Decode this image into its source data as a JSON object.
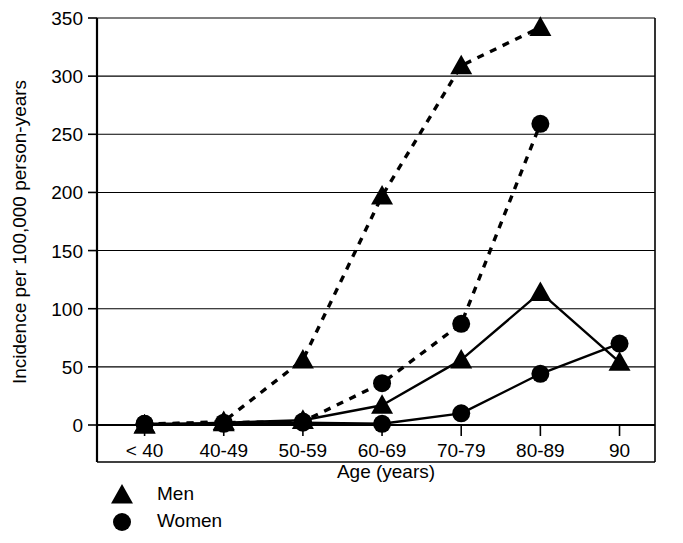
{
  "chart_data": {
    "type": "line",
    "title": "",
    "xlabel": "Age (years)",
    "ylabel": "Incidence per 100,000 person-years",
    "categories": [
      "< 40",
      "40-49",
      "50-59",
      "60-69",
      "70-79",
      "80-89",
      "90"
    ],
    "ylim": [
      0,
      350
    ],
    "yticks": [
      0,
      50,
      100,
      150,
      200,
      250,
      300,
      350
    ],
    "ytick_labels": [
      "0",
      "50",
      "100",
      "150",
      "200",
      "250",
      "300",
      "350"
    ],
    "grid": "horizontal",
    "legend_position": "below-axes-left",
    "series": [
      {
        "name": "Men",
        "marker": "triangle",
        "linestyle": "dashed",
        "group": "upper",
        "values": [
          0,
          3,
          56,
          197,
          309,
          342,
          null
        ]
      },
      {
        "name": "Women",
        "marker": "circle",
        "linestyle": "dashed",
        "group": "upper",
        "values": [
          1,
          2,
          3,
          36,
          87,
          259,
          null
        ]
      },
      {
        "name": "Men",
        "marker": "triangle",
        "linestyle": "solid",
        "group": "lower",
        "values": [
          0,
          2,
          4,
          17,
          56,
          114,
          54
        ]
      },
      {
        "name": "Women",
        "marker": "circle",
        "linestyle": "solid",
        "group": "lower",
        "values": [
          1,
          1,
          2,
          1,
          10,
          44,
          70
        ]
      }
    ],
    "legend": [
      {
        "label": "Men",
        "marker": "triangle"
      },
      {
        "label": "Women",
        "marker": "circle"
      }
    ],
    "colors": {
      "foreground": "#000000",
      "background": "#ffffff",
      "grid": "#000000"
    }
  }
}
